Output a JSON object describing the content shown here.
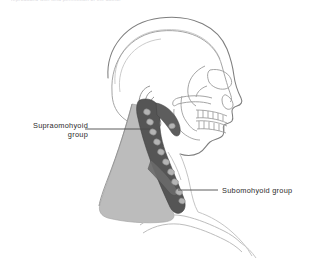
{
  "figure": {
    "title_remnant": "reproduced with kind permission of the author",
    "background": "#ffffff",
    "colors": {
      "outline": "#8d8d8d",
      "outline_light": "#bdbdbd",
      "posterior_triangle_fill": "#bcbcbc",
      "node_chain_fill": "#555555",
      "lymph_node_fill": "#b4b4b4",
      "leader_line": "#4a4a4a",
      "label_text": "#2b2b2b"
    },
    "labels": [
      {
        "id": "supraomohyoid",
        "name": "supraomohyoid-group-label",
        "line1": "Supraomohyoid",
        "line2": "group",
        "leader": {
          "x1": 85,
          "y1": 129,
          "x2": 150,
          "y2": 129
        }
      },
      {
        "id": "subomohyoid",
        "name": "subomohyoid-group-label",
        "line1": "Subomohyoid group",
        "line2": "",
        "leader": {
          "x1": 178,
          "y1": 190,
          "x2": 218,
          "y2": 190
        }
      }
    ],
    "anatomy": [
      {
        "name": "cranium-outline"
      },
      {
        "name": "inner-cranial-vault-line"
      },
      {
        "name": "facial-profile-soft-tissue"
      },
      {
        "name": "orbit"
      },
      {
        "name": "nasal-aperture"
      },
      {
        "name": "zygomatic-arch"
      },
      {
        "name": "maxilla-upper-teeth"
      },
      {
        "name": "mandible-lower-teeth"
      },
      {
        "name": "external-ear-auricle"
      },
      {
        "name": "posterior-cervical-triangle"
      },
      {
        "name": "deep-cervical-node-chain"
      },
      {
        "name": "lymph-node"
      },
      {
        "name": "clavicle"
      },
      {
        "name": "shoulder-contour"
      },
      {
        "name": "trapezius-border"
      }
    ]
  }
}
